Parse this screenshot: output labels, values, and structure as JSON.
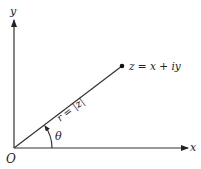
{
  "diagram": {
    "axes": {
      "x_label": "x",
      "y_label": "y",
      "origin_label": "O"
    },
    "point_label": "z = x + iy",
    "radius_label": "r = |z|",
    "angle_label": "θ",
    "colors": {
      "line": "#333333",
      "text": "#222222",
      "background": "#ffffff"
    }
  }
}
